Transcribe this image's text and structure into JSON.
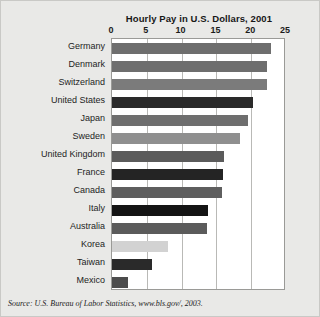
{
  "chart_data": {
    "type": "bar",
    "orientation": "horizontal",
    "title": "Hourly Pay in U.S. Dollars, 2001",
    "xlabel": "",
    "ylabel": "",
    "xlim": [
      0,
      25
    ],
    "xticks": [
      0,
      5,
      10,
      15,
      20,
      25
    ],
    "xtick_labels": [
      "0",
      "5",
      "10",
      "15",
      "20",
      "25"
    ],
    "grid": true,
    "legend": "none",
    "categories": [
      "Germany",
      "Denmark",
      "Switzerland",
      "United States",
      "Japan",
      "Sweden",
      "United Kingdom",
      "France",
      "Canada",
      "Italy",
      "Australia",
      "Korea",
      "Taiwan",
      "Mexico"
    ],
    "values": [
      22.9,
      22.2,
      22.2,
      20.3,
      19.6,
      18.4,
      16.1,
      15.9,
      15.8,
      13.8,
      13.6,
      8.1,
      5.7,
      2.3
    ],
    "bar_colors": [
      "#6e6e6e",
      "#6e6e6e",
      "#7b7b7b",
      "#2a2a2a",
      "#6e6e6e",
      "#8f8f8f",
      "#5b5b5b",
      "#242424",
      "#5e5e5e",
      "#141414",
      "#5b5b5b",
      "#d2d2d2",
      "#2a2a2a",
      "#4c4c4c"
    ],
    "source": "Source: U.S. Bureau of Labor Statistics, www.bls.gov/, 2003."
  },
  "colors": {
    "background": "#e9e9e7",
    "plot_background": "#ffffff",
    "gridline": "#b9b9b6",
    "axis_border": "#9a9a97",
    "text": "#1d1d1d"
  }
}
